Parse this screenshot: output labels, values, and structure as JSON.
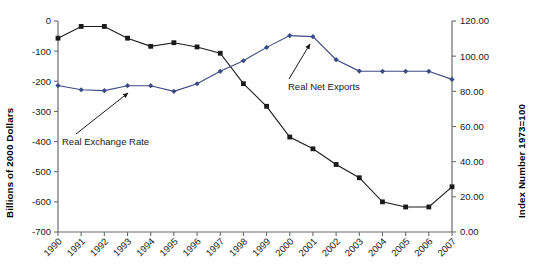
{
  "chart_data": {
    "type": "line",
    "title": "",
    "xlabel": "",
    "ylabel": "Billions of 2000 Dollars",
    "y2label": "Index Number 1973=100",
    "grid": false,
    "legend_position": "inline-annotations",
    "categories": [
      "1990",
      "1991",
      "1992",
      "1993",
      "1994",
      "1995",
      "1996",
      "1997",
      "1998",
      "1999",
      "2000",
      "2001",
      "2002",
      "2003",
      "2004",
      "2005",
      "2006",
      "2007"
    ],
    "ylim": [
      -700,
      0
    ],
    "yticks": [
      0,
      -100,
      -200,
      -300,
      -400,
      -500,
      -600,
      -700
    ],
    "ytick_labels": [
      "0",
      "-100",
      "-200",
      "-300",
      "-400",
      "-500",
      "-600",
      "-700"
    ],
    "y2lim": [
      0,
      120
    ],
    "y2ticks": [
      0,
      20,
      40,
      60,
      80,
      100,
      120
    ],
    "y2tick_labels": [
      "0.00",
      "20.00",
      "40.00",
      "60.00",
      "80.00",
      "100.00",
      "120.00"
    ],
    "series": [
      {
        "name": "Real Net Exports",
        "axis": "left",
        "color": "#1a1a1a",
        "marker": "square",
        "values": [
          -57,
          -18,
          -18,
          -57,
          -84,
          -72,
          -86,
          -107,
          -208,
          -283,
          -385,
          -424,
          -476,
          -520,
          -600,
          -617,
          -617,
          -550
        ]
      },
      {
        "name": "Real Exchange Rate",
        "axis": "right",
        "color": "#3c4a84",
        "marker": "diamond",
        "values": [
          83.3,
          80.9,
          80.4,
          83.2,
          83.2,
          80.0,
          84.3,
          91.4,
          97.4,
          105.0,
          111.7,
          111.1,
          98.0,
          91.5,
          91.4,
          91.4,
          91.4,
          86.8
        ]
      }
    ],
    "annotations": [
      {
        "name": "real-exchange-rate",
        "text": "Real Exchange Rate",
        "label_x": 62,
        "label_y": 145,
        "leader_from_x": 76,
        "leader_from_y": 134,
        "leader_to_x": 128,
        "leader_to_y": 93
      },
      {
        "name": "real-net-exports",
        "text": "Real Net Exports",
        "label_x": 288,
        "label_y": 90,
        "leader_from_x": 289,
        "leader_from_y": 79,
        "leader_to_x": 310,
        "leader_to_y": 44
      }
    ]
  },
  "plot_geometry": {
    "left": 58,
    "right": 452,
    "top": 21,
    "bottom": 232
  }
}
